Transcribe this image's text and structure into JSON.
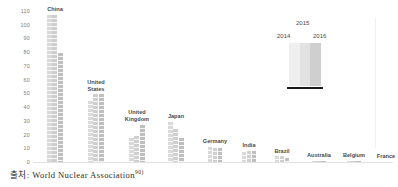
{
  "source": {
    "prefix": "출처:",
    "text": "World Nuclear Association",
    "footnote": "90)"
  },
  "legend": {
    "items": [
      {
        "label": "2014",
        "color": "#efefef"
      },
      {
        "label": "2015",
        "color": "#e2e2e2"
      },
      {
        "label": "2016",
        "color": "#cfcfcf"
      }
    ]
  },
  "chart_data": {
    "type": "bar",
    "title": "",
    "subtitle": "",
    "xlabel": "",
    "ylabel": "",
    "ylim": [
      0,
      110
    ],
    "grid": false,
    "legend_position": "top-right",
    "yticks": [
      110,
      100,
      90,
      80,
      70,
      60,
      50,
      40,
      30,
      20,
      10,
      0
    ],
    "categories": [
      "China",
      "United\nStates",
      "United\nKingdom",
      "Japan",
      "Germany",
      "India",
      "Brazil",
      "Australia",
      "Belgium",
      "France"
    ],
    "series": [
      {
        "name": "2014",
        "color": "#d9d9d9",
        "values": [
          108,
          45,
          18,
          30,
          12,
          8,
          5,
          1.5,
          1.5,
          1
        ]
      },
      {
        "name": "2015",
        "color": "#cfcfcf",
        "values": [
          108,
          50,
          20,
          25,
          11,
          9,
          5,
          1.5,
          1.5,
          1
        ]
      },
      {
        "name": "2016",
        "color": "#bfbfbf",
        "values": [
          80,
          50,
          28,
          18,
          11,
          9,
          4,
          1.5,
          1.5,
          1
        ]
      }
    ]
  }
}
